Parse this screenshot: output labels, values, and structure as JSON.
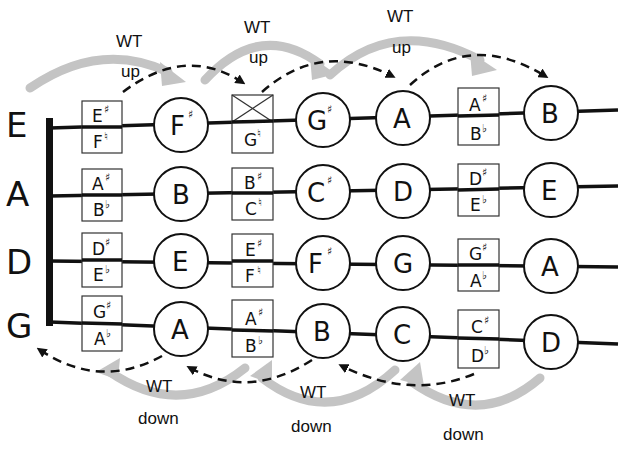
{
  "diagram": {
    "colors": {
      "line": "#111111",
      "gray_arrow": "#c4c4c4",
      "background": "#ffffff"
    },
    "strings": [
      {
        "label": "E",
        "y": 122,
        "cells": [
          {
            "type": "box",
            "top": "E",
            "top_acc": "♯",
            "bottom": "F",
            "bottom_acc": "♮"
          },
          {
            "type": "circle",
            "note": "F",
            "acc": "♯"
          },
          {
            "type": "box-crossed",
            "top": "",
            "top_acc": "",
            "bottom": "G",
            "bottom_acc": "♮"
          },
          {
            "type": "circle",
            "note": "G",
            "acc": "♯"
          },
          {
            "type": "circle",
            "note": "A",
            "acc": ""
          },
          {
            "type": "box",
            "top": "A",
            "top_acc": "♯",
            "bottom": "B",
            "bottom_acc": "♭"
          },
          {
            "type": "circle",
            "note": "B",
            "acc": ""
          }
        ]
      },
      {
        "label": "A",
        "y": 191,
        "cells": [
          {
            "type": "box",
            "top": "A",
            "top_acc": "♯",
            "bottom": "B",
            "bottom_acc": "♭"
          },
          {
            "type": "circle",
            "note": "B",
            "acc": ""
          },
          {
            "type": "box",
            "top": "B",
            "top_acc": "♯",
            "bottom": "C",
            "bottom_acc": "♮"
          },
          {
            "type": "circle",
            "note": "C",
            "acc": "♯"
          },
          {
            "type": "circle",
            "note": "D",
            "acc": ""
          },
          {
            "type": "box",
            "top": "D",
            "top_acc": "♯",
            "bottom": "E",
            "bottom_acc": "♭"
          },
          {
            "type": "circle",
            "note": "E",
            "acc": ""
          }
        ]
      },
      {
        "label": "D",
        "y": 260,
        "cells": [
          {
            "type": "box",
            "top": "D",
            "top_acc": "♯",
            "bottom": "E",
            "bottom_acc": "♭"
          },
          {
            "type": "circle",
            "note": "E",
            "acc": ""
          },
          {
            "type": "box",
            "top": "E",
            "top_acc": "♯",
            "bottom": "F",
            "bottom_acc": "♮"
          },
          {
            "type": "circle",
            "note": "F",
            "acc": "♯"
          },
          {
            "type": "circle",
            "note": "G",
            "acc": ""
          },
          {
            "type": "box",
            "top": "G",
            "top_acc": "♯",
            "bottom": "A",
            "bottom_acc": "♭"
          },
          {
            "type": "circle",
            "note": "A",
            "acc": ""
          }
        ]
      },
      {
        "label": "G",
        "y": 324,
        "cells": [
          {
            "type": "box",
            "top": "G",
            "top_acc": "♯",
            "bottom": "A",
            "bottom_acc": "♭"
          },
          {
            "type": "circle",
            "note": "A",
            "acc": ""
          },
          {
            "type": "box",
            "top": "A",
            "top_acc": "♯",
            "bottom": "B",
            "bottom_acc": "♭"
          },
          {
            "type": "circle",
            "note": "B",
            "acc": ""
          },
          {
            "type": "circle",
            "note": "C",
            "acc": ""
          },
          {
            "type": "box",
            "top": "C",
            "top_acc": "♯",
            "bottom": "D",
            "bottom_acc": "♭"
          },
          {
            "type": "circle",
            "note": "D",
            "acc": ""
          }
        ]
      }
    ],
    "annotations_up": [
      {
        "line1": "WT",
        "line2": "up"
      },
      {
        "line1": "WT",
        "line2": "up"
      },
      {
        "line1": "WT",
        "line2": "up"
      }
    ],
    "annotations_down": [
      {
        "line1": "WT",
        "line2": "down"
      },
      {
        "line1": "WT",
        "line2": "down"
      },
      {
        "line1": "WT",
        "line2": "down"
      }
    ]
  }
}
